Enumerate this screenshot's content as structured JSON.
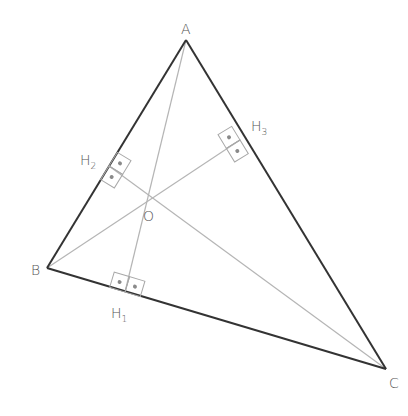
{
  "colors": {
    "side": "#333333",
    "altitude": "#b5b5b5",
    "marker_box": "#a8a8a8",
    "marker_dot": "#8a8a8a",
    "label": "#555555"
  },
  "vertices": {
    "A": {
      "label": "A",
      "x": 186,
      "y": 40
    },
    "B": {
      "label": "B",
      "x": 47,
      "y": 268
    },
    "C": {
      "label": "C",
      "x": 386,
      "y": 369
    }
  },
  "orthocenter": {
    "label": "O",
    "x": 146,
    "y": 200
  },
  "feet": {
    "H1": {
      "label": "H",
      "sub": "1",
      "on_side": "BC",
      "x": 125,
      "y": 292
    },
    "H2": {
      "label": "H",
      "sub": "2",
      "on_side": "AB",
      "x": 109,
      "y": 166
    },
    "H3": {
      "label": "H",
      "sub": "3",
      "on_side": "AC",
      "x": 240,
      "y": 140
    }
  },
  "label_positions": {
    "A": {
      "x": 181,
      "y": 34
    },
    "B": {
      "x": 31,
      "y": 275
    },
    "C": {
      "x": 389,
      "y": 388
    },
    "O": {
      "x": 143,
      "y": 221
    },
    "H1": {
      "x": 111,
      "y": 318
    },
    "H2": {
      "x": 80,
      "y": 165
    },
    "H3": {
      "x": 251,
      "y": 131
    }
  }
}
